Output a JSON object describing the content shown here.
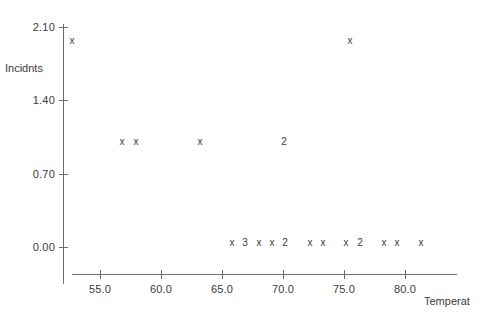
{
  "chart_data": {
    "type": "scatter",
    "title": "",
    "subtitle": "",
    "xlabel": "Temperat",
    "ylabel": "Incidnts",
    "xlim": [
      53.0,
      82.5
    ],
    "ylim": [
      -0.25,
      2.2
    ],
    "grid": false,
    "legend": null,
    "marker_glyph": "x",
    "note": "Character plot: an 'x' marks a single observation; a digit marks that many coincident observations at the same location.",
    "xticks": [
      {
        "value": 55.0,
        "label": "55.0",
        "px": 100
      },
      {
        "value": 60.0,
        "label": "60.0",
        "px": 161
      },
      {
        "value": 65.0,
        "label": "65.0",
        "px": 222
      },
      {
        "value": 70.0,
        "label": "70.0",
        "px": 283
      },
      {
        "value": 75.0,
        "label": "75.0",
        "px": 344
      },
      {
        "value": 80.0,
        "label": "80.0",
        "px": 405
      }
    ],
    "yticks": [
      {
        "value": 2.1,
        "label": "2.10",
        "px": 27
      },
      {
        "value": 1.4,
        "label": "1.40",
        "px": 100
      },
      {
        "value": 0.7,
        "label": "0.70",
        "px": 174
      },
      {
        "value": 0.0,
        "label": "0.00",
        "px": 247
      }
    ],
    "points": [
      {
        "x": 53.0,
        "y": 2.0,
        "count": 1,
        "glyph": "x",
        "px": 72,
        "py": 41
      },
      {
        "x": 75.5,
        "y": 2.0,
        "count": 1,
        "glyph": "x",
        "px": 350,
        "py": 41
      },
      {
        "x": 57.0,
        "y": 1.0,
        "count": 1,
        "glyph": "x",
        "px": 122,
        "py": 142
      },
      {
        "x": 58.0,
        "y": 1.0,
        "count": 1,
        "glyph": "x",
        "px": 136,
        "py": 142
      },
      {
        "x": 63.0,
        "y": 1.0,
        "count": 1,
        "glyph": "x",
        "px": 200,
        "py": 142
      },
      {
        "x": 70.0,
        "y": 1.0,
        "count": 2,
        "glyph": "2",
        "px": 284,
        "py": 142
      },
      {
        "x": 66.5,
        "y": 0.0,
        "count": 1,
        "glyph": "x",
        "px": 232,
        "py": 243
      },
      {
        "x": 67.5,
        "y": 0.0,
        "count": 3,
        "glyph": "3",
        "px": 245,
        "py": 243
      },
      {
        "x": 68.5,
        "y": 0.0,
        "count": 1,
        "glyph": "x",
        "px": 259,
        "py": 243
      },
      {
        "x": 69.5,
        "y": 0.0,
        "count": 1,
        "glyph": "x",
        "px": 272,
        "py": 243
      },
      {
        "x": 70.5,
        "y": 0.0,
        "count": 2,
        "glyph": "2",
        "px": 285,
        "py": 243
      },
      {
        "x": 72.5,
        "y": 0.0,
        "count": 1,
        "glyph": "x",
        "px": 310,
        "py": 243
      },
      {
        "x": 73.5,
        "y": 0.0,
        "count": 1,
        "glyph": "x",
        "px": 323,
        "py": 243
      },
      {
        "x": 75.0,
        "y": 0.0,
        "count": 1,
        "glyph": "x",
        "px": 346,
        "py": 243
      },
      {
        "x": 76.0,
        "y": 0.0,
        "count": 2,
        "glyph": "2",
        "px": 360,
        "py": 243
      },
      {
        "x": 78.0,
        "y": 0.0,
        "count": 1,
        "glyph": "x",
        "px": 384,
        "py": 243
      },
      {
        "x": 79.0,
        "y": 0.0,
        "count": 1,
        "glyph": "x",
        "px": 397,
        "py": 243
      },
      {
        "x": 81.0,
        "y": 0.0,
        "count": 1,
        "glyph": "x",
        "px": 421,
        "py": 243
      }
    ],
    "colors": {
      "background": "#f1f1f1",
      "plot_background": "#ffffff",
      "axis": "#6d6d6d",
      "text": "#3b3b3b",
      "marker": "#3a3a3a"
    }
  }
}
